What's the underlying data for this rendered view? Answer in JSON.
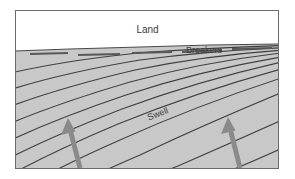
{
  "figure": {
    "type": "cross-section-diagram",
    "frame": {
      "x": 15,
      "y": 10,
      "width": 264,
      "height": 159,
      "border_color": "#6b6b6b",
      "border_width": 1
    },
    "regions": [
      {
        "name": "land",
        "label": "Land",
        "fill": "#ffffff",
        "label_x": 148,
        "label_y": 31,
        "font_size": 10
      },
      {
        "name": "sea",
        "label": "Swell",
        "fill": "#c8c8c8",
        "label_x": 161,
        "label_y": 119,
        "font_size": 9,
        "rotation_deg": -21
      }
    ],
    "labels": {
      "land": "Land",
      "breakers": "Breakers",
      "swell": "Swell"
    },
    "shoreline": {
      "name": "shoreline",
      "color": "#4a4a4a",
      "points": [
        [
          15,
          51
        ],
        [
          70,
          49
        ],
        [
          140,
          47
        ],
        [
          210,
          45
        ],
        [
          279,
          44
        ]
      ]
    },
    "breakers": {
      "label": "Breakers",
      "label_x": 186,
      "label_y": 51,
      "segment_color": "#585858",
      "segments": [
        [
          [
            30,
            54
          ],
          [
            68,
            53
          ]
        ],
        [
          [
            78,
            55
          ],
          [
            120,
            54
          ]
        ],
        [
          [
            132,
            53
          ],
          [
            172,
            52
          ]
        ],
        [
          [
            182,
            52
          ],
          [
            222,
            50
          ]
        ],
        [
          [
            232,
            49
          ],
          [
            272,
            48
          ]
        ]
      ]
    },
    "wave_lines": {
      "name": "swell-crest-lines",
      "color": "#3f3f3f",
      "stroke_width": 1.1,
      "count": 11,
      "description": "Concentric refracted crest arcs, steep at left, flattening toward the shoreline at upper right"
    },
    "arrows": [
      {
        "name": "left-direction-arrow",
        "color": "#8a8a8a",
        "tail_x": 80,
        "tail_y": 166,
        "head_x": 68,
        "head_y": 120,
        "shaft_width": 5,
        "head_width": 13,
        "head_length": 12
      },
      {
        "name": "right-direction-arrow",
        "color": "#8a8a8a",
        "tail_x": 240,
        "tail_y": 166,
        "head_x": 228,
        "head_y": 119,
        "shaft_width": 5,
        "head_width": 13,
        "head_length": 12
      }
    ],
    "colors": {
      "background": "#ffffff",
      "sea_fill": "#c8c8c8",
      "land_fill": "#ffffff",
      "line": "#3f3f3f",
      "arrow": "#8a8a8a",
      "border": "#6b6b6b",
      "text": "#3b3b3b"
    }
  }
}
